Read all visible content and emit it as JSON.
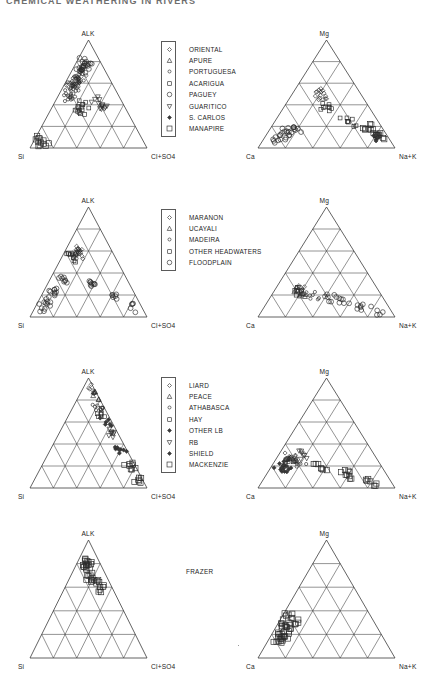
{
  "header": {
    "running_title": "CHEMICAL WEATHERING IN RIVERS"
  },
  "figure": {
    "style": {
      "line_color": "#3b3b3b",
      "grid_color": "#4a4a4a",
      "marker_color": "#2b2b2b",
      "text_color": "#1d1d1d"
    },
    "ternary_axes": {
      "left": {
        "top": "ALK",
        "bottom_left": "Si",
        "bottom_right": "Cl+SO4"
      },
      "right": {
        "top": "Mg",
        "bottom_left": "Ca",
        "bottom_right": "Na+K"
      }
    },
    "grid_divisions": 5
  },
  "rows": [
    {
      "id": "row-orinoco",
      "legend": {
        "type": "boxed",
        "entries": [
          {
            "marker": "diamond-small",
            "label": "ORIENTAL"
          },
          {
            "marker": "triangle-up",
            "label": "APURE"
          },
          {
            "marker": "circle-small",
            "label": "PORTUGUESA"
          },
          {
            "marker": "square-small",
            "label": "ACARIGUA"
          },
          {
            "marker": "circle",
            "label": "PAGUEY"
          },
          {
            "marker": "triangle-down",
            "label": "GUARITICO"
          },
          {
            "marker": "diamond-filled",
            "label": "S. CARLOS"
          },
          {
            "marker": "square",
            "label": "MANAPIRE"
          }
        ]
      }
    },
    {
      "id": "row-amazon",
      "legend": {
        "type": "boxed",
        "entries": [
          {
            "marker": "diamond-small",
            "label": "MARANON"
          },
          {
            "marker": "triangle-up",
            "label": "UCAYALI"
          },
          {
            "marker": "circle-small",
            "label": "MADEIRA"
          },
          {
            "marker": "square-small",
            "label": "OTHER HEADWATERS"
          },
          {
            "marker": "circle",
            "label": "FLOODPLAIN"
          }
        ]
      }
    },
    {
      "id": "row-mackenzie",
      "legend": {
        "type": "boxed",
        "entries": [
          {
            "marker": "diamond-small",
            "label": "LIARD"
          },
          {
            "marker": "triangle-up",
            "label": "PEACE"
          },
          {
            "marker": "circle-small",
            "label": "ATHABASCA"
          },
          {
            "marker": "square-small",
            "label": "HAY"
          },
          {
            "marker": "diamond-filled",
            "label": "OTHER LB"
          },
          {
            "marker": "triangle-down",
            "label": "RB"
          },
          {
            "marker": "diamond-filled",
            "label": "SHIELD"
          },
          {
            "marker": "square",
            "label": "MACKENZIE"
          }
        ]
      }
    },
    {
      "id": "row-frazer",
      "legend": {
        "type": "plain",
        "entries": [
          {
            "marker": "square",
            "label": "FRAZER"
          }
        ]
      }
    }
  ],
  "chart_data": [
    {
      "type": "scatter",
      "id": "orinoco-anion",
      "title": "",
      "ternary": true,
      "corners": [
        "Si",
        "ALK",
        "Cl+SO4"
      ],
      "xlabel": "Si",
      "ylabel": "ALK",
      "note": "Orinoco basin anion/silica ternary",
      "points": [
        {
          "series": "ORIENTAL",
          "a": 0.3,
          "b": 0.62,
          "c": 0.08
        },
        {
          "series": "ORIENTAL",
          "a": 0.26,
          "b": 0.66,
          "c": 0.08
        },
        {
          "series": "ORIENTAL",
          "a": 0.34,
          "b": 0.58,
          "c": 0.08
        },
        {
          "series": "ORIENTAL",
          "a": 0.22,
          "b": 0.7,
          "c": 0.08
        },
        {
          "series": "ORIENTAL",
          "a": 0.38,
          "b": 0.54,
          "c": 0.08
        },
        {
          "series": "PORTUGUESA",
          "a": 0.3,
          "b": 0.6,
          "c": 0.1
        },
        {
          "series": "PORTUGUESA",
          "a": 0.33,
          "b": 0.57,
          "c": 0.1
        },
        {
          "series": "PORTUGUESA",
          "a": 0.27,
          "b": 0.62,
          "c": 0.11
        },
        {
          "series": "PORTUGUESA",
          "a": 0.4,
          "b": 0.5,
          "c": 0.1
        },
        {
          "series": "PORTUGUESA",
          "a": 0.45,
          "b": 0.45,
          "c": 0.1
        },
        {
          "series": "PAGUEY",
          "a": 0.2,
          "b": 0.72,
          "c": 0.08
        },
        {
          "series": "PAGUEY",
          "a": 0.16,
          "b": 0.76,
          "c": 0.08
        },
        {
          "series": "PAGUEY",
          "a": 0.12,
          "b": 0.8,
          "c": 0.08
        },
        {
          "series": "ACARIGUA",
          "a": 0.35,
          "b": 0.4,
          "c": 0.25
        },
        {
          "series": "ACARIGUA",
          "a": 0.4,
          "b": 0.35,
          "c": 0.25
        },
        {
          "series": "MANAPIRE",
          "a": 0.85,
          "b": 0.07,
          "c": 0.08
        },
        {
          "series": "MANAPIRE",
          "a": 0.88,
          "b": 0.05,
          "c": 0.07
        },
        {
          "series": "GUARITICO",
          "a": 0.22,
          "b": 0.45,
          "c": 0.33
        },
        {
          "series": "GUARITICO",
          "a": 0.18,
          "b": 0.4,
          "c": 0.42
        }
      ],
      "cluster_description": "dense cluster near ALK-rich upper region, tail toward Si corner"
    },
    {
      "type": "scatter",
      "id": "orinoco-cation",
      "ternary": true,
      "corners": [
        "Ca",
        "Mg",
        "Na+K"
      ],
      "xlabel": "Ca",
      "ylabel": "Mg",
      "note": "Orinoco basin cation ternary",
      "points": [
        {
          "series": "PAGUEY",
          "a": 0.62,
          "b": 0.18,
          "c": 0.2
        },
        {
          "series": "PAGUEY",
          "a": 0.7,
          "b": 0.15,
          "c": 0.15
        },
        {
          "series": "PAGUEY",
          "a": 0.78,
          "b": 0.12,
          "c": 0.1
        },
        {
          "series": "PAGUEY",
          "a": 0.85,
          "b": 0.08,
          "c": 0.07
        },
        {
          "series": "ORIENTAL",
          "a": 0.3,
          "b": 0.45,
          "c": 0.25
        },
        {
          "series": "ORIENTAL",
          "a": 0.28,
          "b": 0.52,
          "c": 0.2
        },
        {
          "series": "ACARIGUA",
          "a": 0.32,
          "b": 0.38,
          "c": 0.3
        },
        {
          "series": "ACARIGUA",
          "a": 0.22,
          "b": 0.24,
          "c": 0.54
        },
        {
          "series": "MANAPIRE",
          "a": 0.1,
          "b": 0.18,
          "c": 0.72
        },
        {
          "series": "MANAPIRE",
          "a": 0.06,
          "b": 0.12,
          "c": 0.82
        },
        {
          "series": "S. CARLOS",
          "a": 0.08,
          "b": 0.1,
          "c": 0.82
        }
      ],
      "cluster_description": "dense cluster along Ca-rich lower-left edge; outliers toward Na+K"
    },
    {
      "type": "scatter",
      "id": "amazon-anion",
      "ternary": true,
      "corners": [
        "Si",
        "ALK",
        "Cl+SO4"
      ],
      "xlabel": "Si",
      "ylabel": "ALK",
      "note": "Amazon basin anion/silica ternary",
      "points": [
        {
          "series": "MARANON",
          "a": 0.28,
          "b": 0.62,
          "c": 0.1
        },
        {
          "series": "MARANON",
          "a": 0.32,
          "b": 0.56,
          "c": 0.12
        },
        {
          "series": "UCAYALI",
          "a": 0.3,
          "b": 0.58,
          "c": 0.12
        },
        {
          "series": "MADEIRA",
          "a": 0.35,
          "b": 0.55,
          "c": 0.1
        },
        {
          "series": "OTHER HEADWATERS",
          "a": 0.36,
          "b": 0.54,
          "c": 0.1
        },
        {
          "series": "FLOODPLAIN",
          "a": 0.55,
          "b": 0.35,
          "c": 0.1
        },
        {
          "series": "FLOODPLAIN",
          "a": 0.68,
          "b": 0.22,
          "c": 0.1
        },
        {
          "series": "FLOODPLAIN",
          "a": 0.78,
          "b": 0.14,
          "c": 0.08
        },
        {
          "series": "FLOODPLAIN",
          "a": 0.86,
          "b": 0.08,
          "c": 0.06
        },
        {
          "series": "FLOODPLAIN",
          "a": 0.3,
          "b": 0.3,
          "c": 0.4
        },
        {
          "series": "FLOODPLAIN",
          "a": 0.2,
          "b": 0.18,
          "c": 0.62
        },
        {
          "series": "FLOODPLAIN",
          "a": 0.1,
          "b": 0.08,
          "c": 0.82
        }
      ],
      "cluster_description": "upper-left cluster with a trail down the Si edge and along the base"
    },
    {
      "type": "scatter",
      "id": "amazon-cation",
      "ternary": true,
      "corners": [
        "Ca",
        "Mg",
        "Na+K"
      ],
      "xlabel": "Ca",
      "ylabel": "Mg",
      "note": "Amazon basin cation ternary",
      "points": [
        {
          "series": "MARANON",
          "a": 0.55,
          "b": 0.25,
          "c": 0.2
        },
        {
          "series": "UCAYALI",
          "a": 0.58,
          "b": 0.22,
          "c": 0.2
        },
        {
          "series": "MADEIRA",
          "a": 0.5,
          "b": 0.2,
          "c": 0.3
        },
        {
          "series": "OTHER HEADWATERS",
          "a": 0.6,
          "b": 0.24,
          "c": 0.16
        },
        {
          "series": "FLOODPLAIN",
          "a": 0.4,
          "b": 0.18,
          "c": 0.42
        },
        {
          "series": "FLOODPLAIN",
          "a": 0.3,
          "b": 0.16,
          "c": 0.54
        },
        {
          "series": "FLOODPLAIN",
          "a": 0.2,
          "b": 0.1,
          "c": 0.7
        },
        {
          "series": "FLOODPLAIN",
          "a": 0.1,
          "b": 0.06,
          "c": 0.84
        }
      ],
      "cluster_description": "broad Ca-dominated cluster with points spreading toward Na+K"
    },
    {
      "type": "scatter",
      "id": "mackenzie-anion",
      "ternary": true,
      "corners": [
        "Si",
        "ALK",
        "Cl+SO4"
      ],
      "xlabel": "Si",
      "ylabel": "ALK",
      "note": "Mackenzie basin anion/silica ternary",
      "points": [
        {
          "series": "LIARD",
          "a": 0.04,
          "b": 0.9,
          "c": 0.06
        },
        {
          "series": "PEACE",
          "a": 0.04,
          "b": 0.84,
          "c": 0.12
        },
        {
          "series": "ATHABASCA",
          "a": 0.05,
          "b": 0.75,
          "c": 0.2
        },
        {
          "series": "HAY",
          "a": 0.05,
          "b": 0.68,
          "c": 0.27
        },
        {
          "series": "OTHER LB",
          "a": 0.05,
          "b": 0.6,
          "c": 0.35
        },
        {
          "series": "RB",
          "a": 0.05,
          "b": 0.5,
          "c": 0.45
        },
        {
          "series": "SHIELD",
          "a": 0.05,
          "b": 0.35,
          "c": 0.6
        },
        {
          "series": "MACKENZIE",
          "a": 0.05,
          "b": 0.2,
          "c": 0.75
        },
        {
          "series": "MACKENZIE",
          "a": 0.04,
          "b": 0.06,
          "c": 0.9
        }
      ],
      "cluster_description": "points lie along the ALK-(Cl+SO4) right edge, very low Si"
    },
    {
      "type": "scatter",
      "id": "mackenzie-cation",
      "ternary": true,
      "corners": [
        "Ca",
        "Mg",
        "Na+K"
      ],
      "xlabel": "Ca",
      "ylabel": "Mg",
      "note": "Mackenzie basin cation ternary",
      "points": [
        {
          "series": "LIARD",
          "a": 0.62,
          "b": 0.28,
          "c": 0.1
        },
        {
          "series": "PEACE",
          "a": 0.6,
          "b": 0.25,
          "c": 0.15
        },
        {
          "series": "ATHABASCA",
          "a": 0.58,
          "b": 0.22,
          "c": 0.2
        },
        {
          "series": "HAY",
          "a": 0.66,
          "b": 0.24,
          "c": 0.1
        },
        {
          "series": "OTHER LB",
          "a": 0.7,
          "b": 0.2,
          "c": 0.1
        },
        {
          "series": "RB",
          "a": 0.52,
          "b": 0.3,
          "c": 0.18
        },
        {
          "series": "SHIELD",
          "a": 0.75,
          "b": 0.15,
          "c": 0.1
        },
        {
          "series": "MACKENZIE",
          "a": 0.45,
          "b": 0.18,
          "c": 0.37
        },
        {
          "series": "MACKENZIE",
          "a": 0.3,
          "b": 0.12,
          "c": 0.58
        },
        {
          "series": "MACKENZIE",
          "a": 0.15,
          "b": 0.06,
          "c": 0.79
        }
      ],
      "cluster_description": "Ca-rich cluster lower-left, few points trailing to Na+K along the base"
    },
    {
      "type": "scatter",
      "id": "frazer-anion",
      "ternary": true,
      "corners": [
        "Si",
        "ALK",
        "Cl+SO4"
      ],
      "xlabel": "Si",
      "ylabel": "ALK",
      "note": "Frazer river anion/silica ternary",
      "points": [
        {
          "series": "FRAZER",
          "a": 0.12,
          "b": 0.8,
          "c": 0.08
        },
        {
          "series": "FRAZER",
          "a": 0.14,
          "b": 0.76,
          "c": 0.1
        },
        {
          "series": "FRAZER",
          "a": 0.1,
          "b": 0.82,
          "c": 0.08
        },
        {
          "series": "FRAZER",
          "a": 0.16,
          "b": 0.7,
          "c": 0.14
        },
        {
          "series": "FRAZER",
          "a": 0.12,
          "b": 0.66,
          "c": 0.22
        },
        {
          "series": "FRAZER",
          "a": 0.1,
          "b": 0.6,
          "c": 0.3
        }
      ],
      "cluster_description": "tight group of squares just below the ALK apex"
    },
    {
      "type": "scatter",
      "id": "frazer-cation",
      "ternary": true,
      "corners": [
        "Ca",
        "Mg",
        "Na+K"
      ],
      "xlabel": "Ca",
      "ylabel": "Na+K",
      "note": "Frazer river cation ternary",
      "points": [
        {
          "series": "FRAZER",
          "a": 0.62,
          "b": 0.3,
          "c": 0.08
        },
        {
          "series": "FRAZER",
          "a": 0.66,
          "b": 0.26,
          "c": 0.08
        },
        {
          "series": "FRAZER",
          "a": 0.7,
          "b": 0.22,
          "c": 0.08
        },
        {
          "series": "FRAZER",
          "a": 0.74,
          "b": 0.18,
          "c": 0.08
        },
        {
          "series": "FRAZER",
          "a": 0.78,
          "b": 0.14,
          "c": 0.08
        },
        {
          "series": "FRAZER",
          "a": 0.58,
          "b": 0.34,
          "c": 0.08
        }
      ],
      "cluster_description": "squares on the Ca-Mg side of the diagram, low Na+K"
    }
  ]
}
